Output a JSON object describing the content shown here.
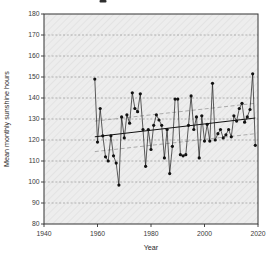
{
  "window": {
    "background_color": "#ffffff",
    "clipped_title_mark_visible": true
  },
  "chart_data": {
    "type": "line",
    "title": "",
    "xlabel": "Year",
    "ylabel": "Mean monthly sunshine hours",
    "xlim": [
      1940,
      2020
    ],
    "ylim": [
      80,
      180
    ],
    "x_ticks": [
      1940,
      1960,
      1980,
      2000,
      2020
    ],
    "y_ticks": [
      80,
      90,
      100,
      110,
      120,
      130,
      140,
      150,
      160,
      170,
      180
    ],
    "grid": "horizontal-dashed",
    "legend": "none",
    "plot_background": "hatched-light-gray",
    "series": [
      {
        "name": "annual-mean-monthly-sunshine",
        "style": "points-line",
        "color": "#1a1a1a",
        "x": [
          1959,
          1960,
          1961,
          1962,
          1963,
          1964,
          1965,
          1966,
          1967,
          1968,
          1969,
          1970,
          1971,
          1972,
          1973,
          1974,
          1975,
          1976,
          1977,
          1978,
          1979,
          1980,
          1981,
          1982,
          1983,
          1984,
          1985,
          1986,
          1987,
          1988,
          1989,
          1990,
          1991,
          1992,
          1993,
          1994,
          1995,
          1996,
          1997,
          1998,
          1999,
          2000,
          2001,
          2002,
          2003,
          2004,
          2005,
          2006,
          2007,
          2008,
          2009,
          2010,
          2011,
          2012,
          2013,
          2014,
          2015,
          2016,
          2017,
          2018,
          2019
        ],
        "values": [
          149,
          119,
          135,
          122,
          112,
          110,
          122,
          112.5,
          109,
          98.5,
          131,
          121,
          132,
          128,
          142.5,
          135,
          133.5,
          142,
          125,
          107.5,
          125,
          115.5,
          127,
          132,
          129.5,
          127,
          111.5,
          125,
          104,
          117,
          139.5,
          139.5,
          113,
          112.5,
          113,
          127,
          141,
          125,
          131,
          111.5,
          131.5,
          119.5,
          127.5,
          119.5,
          147,
          120,
          123,
          125,
          121,
          122.5,
          125,
          121.5,
          131.5,
          129,
          135,
          137.5,
          128.5,
          131,
          134.5,
          151.5,
          117.5
        ]
      },
      {
        "name": "linear-trend",
        "style": "solid-line",
        "color": "#111111",
        "x": [
          1959,
          2019
        ],
        "values": [
          121.5,
          130.5
        ]
      },
      {
        "name": "band-upper",
        "style": "dashed-line",
        "color": "#9a9a9a",
        "x": [
          1959,
          2019
        ],
        "values": [
          129,
          137.5
        ]
      },
      {
        "name": "band-lower",
        "style": "dashed-line",
        "color": "#9a9a9a",
        "x": [
          1959,
          2019
        ],
        "values": [
          114.5,
          123
        ]
      }
    ],
    "colors": {
      "axis": "#333333",
      "gridline": "#7d7d7d",
      "marker": "#111111",
      "plot_bg_base": "#ededed",
      "plot_bg_hatch": "#e1e1e1"
    }
  }
}
